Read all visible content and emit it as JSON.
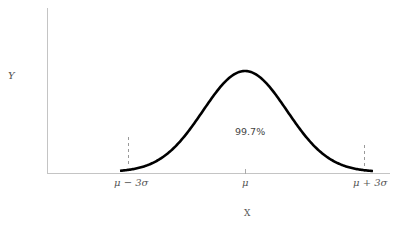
{
  "chart_data": {
    "type": "line",
    "title": "",
    "xlabel": "X",
    "ylabel": "Y",
    "tick_labels": [
      "μ − 3σ",
      "μ",
      "μ + 3σ"
    ],
    "annotation": "99.7%",
    "x_range": [
      "μ − 3σ",
      "μ + 3σ"
    ],
    "x": [
      -3,
      -2.5,
      -2,
      -1.5,
      -1,
      -0.5,
      0,
      0.5,
      1,
      1.5,
      2,
      2.5,
      3
    ],
    "values": [
      0.004,
      0.018,
      0.054,
      0.13,
      0.242,
      0.352,
      0.399,
      0.352,
      0.242,
      0.13,
      0.054,
      0.018,
      0.004
    ],
    "markers": [
      {
        "at": "μ − 3σ",
        "style": "dashed"
      },
      {
        "at": "μ + 3σ",
        "style": "dashed"
      }
    ],
    "grid": false,
    "legend": "none"
  },
  "labels": {
    "y_axis": "Y",
    "x_axis": "X",
    "tick_left": "μ − 3σ",
    "tick_mid": "μ",
    "tick_right": "μ + 3σ",
    "area_pct": "99.7%"
  },
  "colors": {
    "curve": "#000000",
    "axis": "#bbbbbb",
    "dash": "#999999"
  }
}
